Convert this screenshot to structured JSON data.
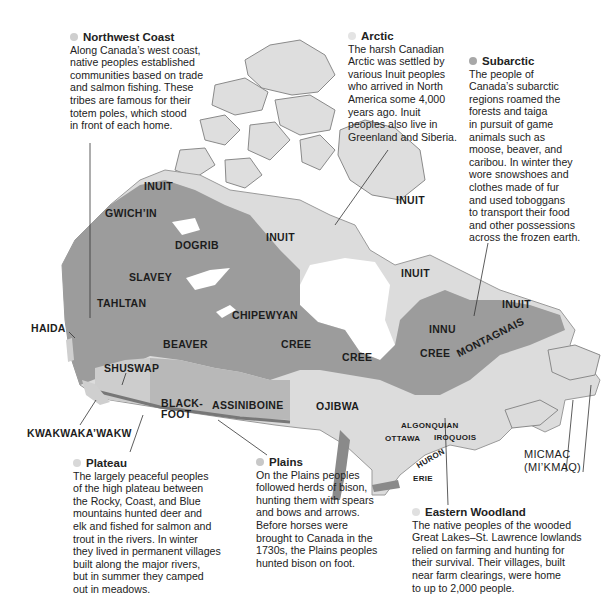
{
  "colors": {
    "subarctic_region": "#9c9c9c",
    "arctic_region": "#dedede",
    "light_region": "#d2d2d2",
    "coast_shadow": "#7a7a7a",
    "water": "#ffffff",
    "dot_arctic": "#dcdcdc",
    "dot_subarctic": "#a8a8a8",
    "dot_light": "#cfcfcf"
  },
  "callouts": {
    "northwest_coast": {
      "title": "Northwest Coast",
      "body": "Along Canada’s west coast,\nnative peoples established\ncommunities based on trade\nand salmon fishing. These\ntribes are famous for their\ntotem poles, which stood\nin front of each home."
    },
    "arctic": {
      "title": "Arctic",
      "body": "The harsh Canadian\nArctic was settled by\nvarious Inuit peoples\nwho arrived in North\nAmerica some 4,000\nyears ago. Inuit\npeoples also live in\nGreenland and Siberia."
    },
    "subarctic": {
      "title": "Subarctic",
      "body": "The people of\nCanada’s subarctic\nregions roamed the\nforests and taiga\nin pursuit of game\nanimals such as\nmoose, beaver, and\ncaribou. In winter they\nwore snowshoes and\nclothes made of fur\nand used toboggans\nto transport their food\nand other possessions\nacross the frozen earth."
    },
    "plateau": {
      "title": "Plateau",
      "body": "The largely peaceful peoples\nof the high plateau between\nthe Rocky, Coast, and Blue\nmountains hunted deer and\nelk and fished for salmon and\ntrout in the rivers. In winter\nthey lived in permanent villages\nbuilt along the major rivers,\nbut in summer they camped\nout in meadows."
    },
    "plains": {
      "title": "Plains",
      "body": "On the Plains peoples\nfollowed herds of bison,\nhunting them with spears\nand bows and arrows.\nBefore horses were\nbrought to Canada in the\n1730s, the Plains peoples\nhunted bison on foot."
    },
    "eastern_woodland": {
      "title": "Eastern Woodland",
      "body": "The native peoples of the wooded\nGreat Lakes–St. Lawrence lowlands\nrelied on farming and hunting for\ntheir survival. Their villages, built\nnear farm clearings, were home\nto up to 2,000 people."
    }
  },
  "map_labels": {
    "inuit_nw": "INUIT",
    "gwichin": "GWICH’IN",
    "dogrib": "DOGRIB",
    "inuit_central": "INUIT",
    "inuit_baffin": "INUIT",
    "slavey": "SLAVEY",
    "tahltan": "TAHLTAN",
    "haida": "HAIDA",
    "chipewyan": "CHIPEWYAN",
    "beaver": "BEAVER",
    "cree_west": "CREE",
    "cree_central": "CREE",
    "cree_east": "CREE",
    "inuit_ungava": "INUIT",
    "inuit_labrador": "INUIT",
    "innu": "INNU",
    "montagnais": "MONTAGNAIS",
    "shuswap": "SHUSWAP",
    "blackfoot": "BLACK-\nFOOT",
    "assiniboine": "ASSINIBOINE",
    "ojibwa": "OJIBWA",
    "kwakwakawakw": "KWAKWAKA’WAKW",
    "algonquian": "ALGONQUIAN",
    "ottawa": "OTTAWA",
    "iroquois": "IROQUOIS",
    "huron": "HURON",
    "erie": "ERIE",
    "micmac": "MICMAC\n(MI’KMAQ)"
  }
}
